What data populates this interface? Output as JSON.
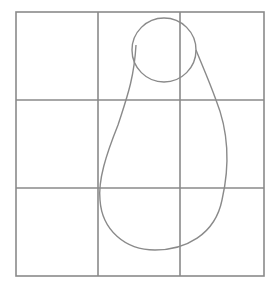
{
  "diagram": {
    "grid": {
      "rows": 3,
      "cols": 3,
      "line_color": "#8a8a8a"
    },
    "shape": {
      "description": "pear-like outline with a circle at the top",
      "stroke_color": "#8a8a8a"
    }
  }
}
